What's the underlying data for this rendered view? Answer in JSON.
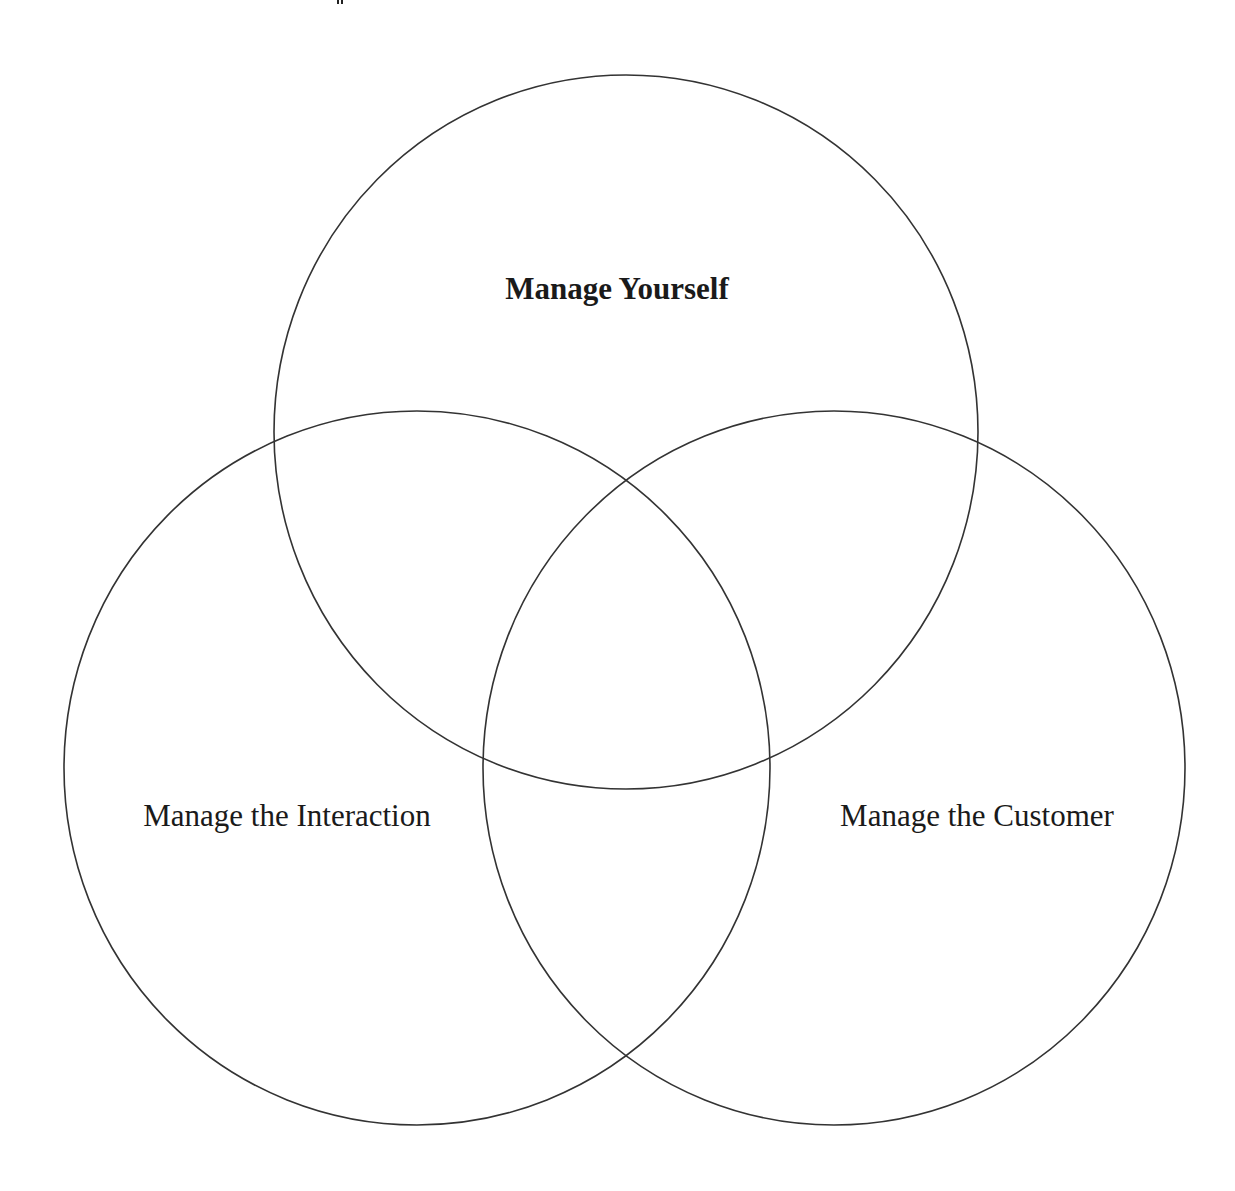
{
  "diagram": {
    "type": "venn",
    "stroke_color": "#333333",
    "background": "#ffffff",
    "circles": [
      {
        "id": "top",
        "label": "Manage Yourself",
        "bold": true,
        "cx": 626,
        "cy": 432,
        "rx": 352,
        "ry": 357,
        "label_x": 617,
        "label_y": 289
      },
      {
        "id": "left",
        "label": "Manage the Interaction",
        "bold": false,
        "cx": 417,
        "cy": 768,
        "rx": 353,
        "ry": 357,
        "label_x": 287,
        "label_y": 816
      },
      {
        "id": "right",
        "label": "Manage the Customer",
        "bold": false,
        "cx": 834,
        "cy": 768,
        "rx": 351,
        "ry": 357,
        "label_x": 977,
        "label_y": 816
      }
    ]
  }
}
